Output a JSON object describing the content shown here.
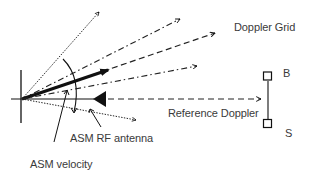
{
  "diagram": {
    "labels": {
      "doppler_grid": "Doppler Grid",
      "reference_doppler": "Reference Doppler",
      "asm_rf_antenna": "ASM RF antenna",
      "asm_velocity": "ASM velocity",
      "baseline_top": "B",
      "baseline_bottom": "S"
    },
    "colors": {
      "stroke": "#111111",
      "text": "#3a3a3a",
      "background": "#ffffff"
    },
    "elements": [
      "antenna-vertical-line",
      "reference-axis-line",
      "rf-antenna-triangle",
      "reference-doppler-dashed-arrow",
      "doppler-grid-dotted-arrow-top",
      "doppler-grid-dashdot-arrow-upper",
      "doppler-grid-dashed-arrow",
      "asm-velocity-thick-arrow",
      "doppler-grid-dashdot-arrow-lower",
      "doppler-grid-dotted-arrow-bottom",
      "angle-arc",
      "baseline-b-s"
    ]
  }
}
